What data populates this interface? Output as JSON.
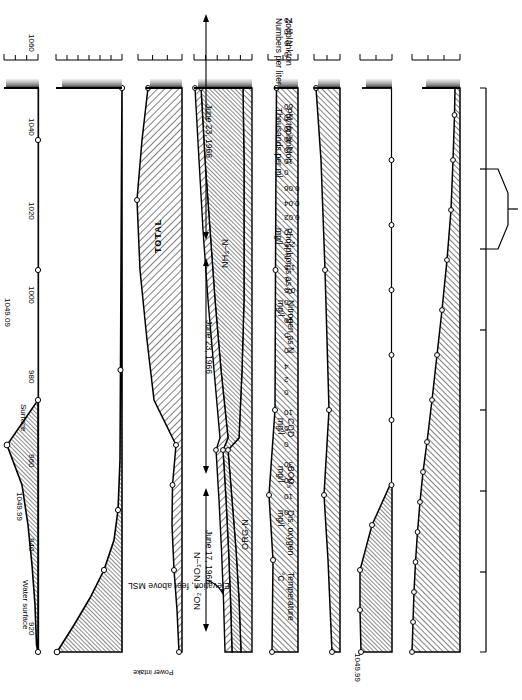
{
  "figure": {
    "orientation": "rotated-90-ccw",
    "x_axis": {
      "title": "Elevation, feet above MSL",
      "ticks": [
        1060,
        1040,
        1020,
        1000,
        980,
        960,
        940,
        920
      ],
      "annotation": "Power intake",
      "annotation_range": [
        965,
        945
      ]
    },
    "annotations": {
      "water_surface": "Water surface",
      "surface": "Surface",
      "elev_do": "1049.99",
      "elev_n": "1049.09",
      "total": "TOTAL",
      "org_n": "ORG-N",
      "nh3_n": "NH₃–N",
      "no2_no3_n": "NO₂ + NO₃–N"
    },
    "dates": [
      {
        "label": "June 23, 1966",
        "panels": [
          "zooplankton",
          "phytoplankton"
        ]
      },
      {
        "label": "June 23, 1966",
        "panels": [
          "phosphorus",
          "nitrogen",
          "cod",
          "bod"
        ]
      },
      {
        "label": "June 17, 1966",
        "panels": [
          "dissolved-oxygen",
          "temperature"
        ]
      }
    ]
  },
  "chart_data": {
    "type": "area",
    "xlabel": "Elevation, feet above MSL",
    "xlim": [
      1060,
      920
    ],
    "x_ticks": [
      1060,
      1040,
      1020,
      1000,
      980,
      960,
      940,
      920
    ],
    "panels": [
      {
        "id": "zooplankton",
        "ylabel": "Zooplankton\nNumbers per liter",
        "ylabel_line1": "Zooplankton",
        "ylabel_line2": "Numbers per liter",
        "ylim": [
          0,
          75
        ],
        "y_ticks": [
          0,
          25,
          50,
          75
        ],
        "x": [
          1050,
          1040,
          1030,
          1020,
          1010,
          1000,
          990,
          980,
          970,
          960
        ],
        "values": [
          8,
          11,
          14,
          22,
          30,
          52,
          0,
          0,
          0,
          0
        ],
        "date": "June 23, 1966"
      },
      {
        "id": "phytoplankton",
        "ylabel_line1": "Phytoplankton",
        "ylabel_line2": "Thousands per ml",
        "ylim": [
          0,
          60
        ],
        "y_ticks": [
          0,
          10,
          20,
          30,
          40,
          50,
          60
        ],
        "x": [
          1050,
          1040,
          1030,
          1020,
          1010,
          1000,
          980,
          960,
          945
        ],
        "values": [
          60,
          38,
          21,
          9,
          3.5,
          2.5,
          2,
          1.8,
          1.5
        ],
        "date": "June 23, 1966"
      },
      {
        "id": "phosphorus",
        "ylabel_line1": "Phosphorus as P",
        "ylabel_line2": "mg/l",
        "ylim": [
          0,
          0.06
        ],
        "y_ticks": [
          0,
          0.02,
          0.04,
          0.06
        ],
        "series_label": "TOTAL",
        "x": [
          1050,
          1040,
          1030,
          1020,
          1010,
          1000,
          985,
          970,
          955,
          945
        ],
        "values": [
          0.006,
          0.009,
          0.013,
          0.015,
          0.014,
          0.01,
          0.03,
          0.048,
          0.057,
          0.047
        ],
        "date": "June 23, 1966"
      },
      {
        "id": "nitrogen",
        "ylabel_line1": "Nitrogen as N",
        "ylabel_line2": "mg/l",
        "ylim": [
          0,
          2.5
        ],
        "y_ticks": [
          0,
          0.5,
          1.0,
          1.5,
          2.0,
          2.5
        ],
        "elev_marker": "1049.09",
        "series": [
          {
            "name": "ORG-N",
            "values": [
              0.42,
              0.46,
              0.52,
              0.6,
              0.68,
              0.4,
              0.33,
              0.3,
              0.3,
              0.32
            ]
          },
          {
            "name": "NH₃–N",
            "values": [
              0.3,
              0.31,
              0.33,
              0.34,
              0.3,
              0.55,
              0.78,
              1.0,
              1.2,
              1.32
            ]
          },
          {
            "name": "NO₂ + NO₃–N",
            "values": [
              0.24,
              0.25,
              0.26,
              0.28,
              0.25,
              0.3,
              0.35,
              0.4,
              0.45,
              0.48
            ]
          }
        ],
        "totals": [
          0.96,
          1.02,
          1.11,
          1.22,
          1.23,
          1.25,
          1.46,
          1.7,
          1.95,
          2.12
        ],
        "x": [
          1050,
          1040,
          1030,
          1020,
          1010,
          1000,
          985,
          970,
          955,
          945
        ],
        "date": "June 23, 1966"
      },
      {
        "id": "cod",
        "ylabel_line1": "COD",
        "ylabel_line2": "mg/l",
        "ylim": [
          0,
          10
        ],
        "y_ticks": [
          0,
          5,
          10
        ],
        "marker_label": "Surface",
        "x": [
          1050,
          1035,
          1020,
          1005,
          985,
          965,
          945
        ],
        "values": [
          7.4,
          7.3,
          7.9,
          7.2,
          7.1,
          7.0,
          6.9
        ],
        "date": "June 23, 1966"
      },
      {
        "id": "bod",
        "ylabel_line1": "BOD₅",
        "ylabel_line2": "mg/l",
        "ylim": [
          0,
          4
        ],
        "y_ticks": [
          0,
          2,
          4
        ],
        "x": [
          1050,
          1035,
          1020,
          1005,
          985,
          965,
          945
        ],
        "values": [
          1.5,
          1.7,
          2.1,
          1.8,
          2.0,
          2.4,
          2.8
        ],
        "date": "June 23, 1966"
      },
      {
        "id": "dissolved-oxygen",
        "ylabel_line1": "Dis. oxygen",
        "ylabel_line2": "mg/l",
        "ylim": [
          0,
          10
        ],
        "y_ticks": [
          0,
          5,
          10
        ],
        "elev_marker": "1049.99",
        "x": [
          1050,
          1042,
          1033,
          1022,
          1010,
          1000,
          988,
          975,
          962,
          950
        ],
        "values": [
          8.8,
          8.9,
          8.9,
          5.6,
          0.2,
          0.2,
          0.2,
          0.2,
          0.2,
          0.2
        ],
        "date": "June 17, 1966"
      },
      {
        "id": "temperature",
        "ylabel_line1": "Temperature",
        "ylabel_line2": "°C",
        "ylim": [
          0,
          30
        ],
        "y_ticks": [
          0,
          10,
          20,
          30
        ],
        "marker_label": "Water surface",
        "x": [
          1050,
          1044,
          1038,
          1032,
          1026,
          1020,
          1014,
          1008,
          1000,
          992,
          984,
          974,
          964,
          954,
          945
        ],
        "values": [
          25.5,
          25.3,
          25.1,
          24.7,
          24.2,
          23.6,
          22.9,
          22.0,
          20.5,
          19.0,
          17.4,
          15.6,
          14.0,
          13.2,
          12.8
        ],
        "date": "June 17, 1966"
      }
    ]
  }
}
